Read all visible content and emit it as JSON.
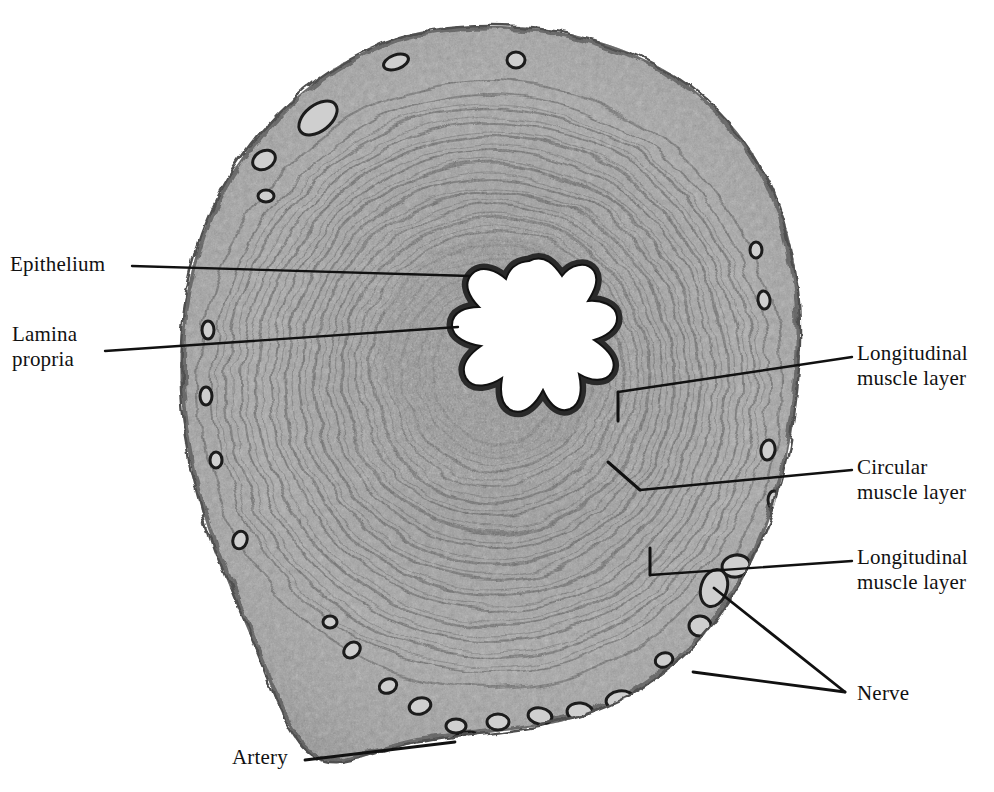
{
  "figure": {
    "background_color": "#ffffff",
    "ink_color": "#111111",
    "specimen_tone_light": "#b9b9b9",
    "specimen_tone_mid": "#8f8f8f",
    "specimen_tone_dark": "#4a4a4a",
    "lumen_color": "#ffffff"
  },
  "labels": {
    "epithelium": "Epithelium",
    "lamina_propria": "Lamina\npropria",
    "longitudinal_muscle_inner": "Longitudinal\nmuscle layer",
    "circular_muscle": "Circular\nmuscle layer",
    "longitudinal_muscle_outer": "Longitudinal\nmuscle layer",
    "nerve": "Nerve",
    "artery": "Artery"
  },
  "leaders": [
    {
      "name": "epithelium",
      "points": "132,266 470,276"
    },
    {
      "name": "lamina-propria",
      "points": "105,351 458,327"
    },
    {
      "name": "longitudinal-muscle-inner",
      "points": "852,357 618,392"
    },
    {
      "name": "longitudinal-muscle-inner-tick",
      "points": "618,392 618,421"
    },
    {
      "name": "circular-muscle",
      "points": "852,470 640,490"
    },
    {
      "name": "circular-muscle-tick",
      "points": "640,490 608,462"
    },
    {
      "name": "longitudinal-muscle-outer",
      "points": "852,561 650,575"
    },
    {
      "name": "longitudinal-muscle-outer-tick",
      "points": "650,575 650,548"
    },
    {
      "name": "nerve-upper",
      "points": "845,692 714,588"
    },
    {
      "name": "nerve-lower",
      "points": "845,692 693,672"
    },
    {
      "name": "artery",
      "points": "305,760 455,742"
    }
  ],
  "structures": {
    "lumen_shape": "stellate / star-folded lumen outlined by dark epithelium",
    "layers_outward": [
      "Epithelium",
      "Lamina propria",
      "Longitudinal muscle layer",
      "Circular muscle layer",
      "Longitudinal muscle layer",
      "Adventitia with nerves and artery"
    ],
    "nerve_bundle_count": 2,
    "artery_location": "bottom-left ragged margin"
  }
}
